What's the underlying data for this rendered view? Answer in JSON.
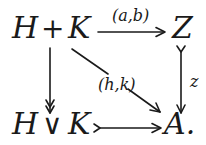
{
  "diagram": {
    "type": "commutative-square",
    "nodes": {
      "top_left": {
        "left": "H",
        "op": "+",
        "right": "K"
      },
      "top_right": {
        "label": "Z"
      },
      "bottom_left": {
        "left": "H",
        "op": "∨",
        "right": "K"
      },
      "bottom_right": {
        "label": "A."
      }
    },
    "arrows": {
      "top": {
        "from": "H + K",
        "to": "Z",
        "label": "(a,b)",
        "style": "plain"
      },
      "left": {
        "from": "H + K",
        "to": "H ∨ K",
        "label": "",
        "style": "epi (double head)"
      },
      "right": {
        "from": "Z",
        "to": "A",
        "label": "z",
        "style": "mono (tail)"
      },
      "bottom": {
        "from": "H ∨ K",
        "to": "A",
        "label": "",
        "style": "mono (tail)"
      },
      "diagonal": {
        "from": "H + K",
        "to": "A",
        "label": "(h,k)",
        "style": "plain"
      }
    }
  }
}
